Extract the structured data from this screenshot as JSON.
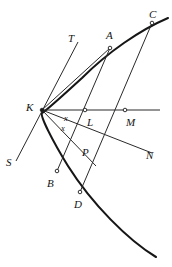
{
  "figure": {
    "kind": "geometry-diagram",
    "background_color": "#ffffff",
    "stroke_color": "#1a1a1a",
    "curve_color": "#161616",
    "view": {
      "width": 172,
      "height": 267
    },
    "labels": [
      {
        "id": "T",
        "text": "T",
        "x": 68,
        "y": 33,
        "size": "normal"
      },
      {
        "id": "A",
        "text": "A",
        "x": 106,
        "y": 30,
        "size": "normal"
      },
      {
        "id": "C",
        "text": "C",
        "x": 149,
        "y": 9,
        "size": "normal"
      },
      {
        "id": "K",
        "text": "K",
        "x": 26,
        "y": 102,
        "size": "normal"
      },
      {
        "id": "x1",
        "text": "x",
        "x": 64,
        "y": 114,
        "size": "small"
      },
      {
        "id": "L",
        "text": "L",
        "x": 87,
        "y": 117,
        "size": "normal"
      },
      {
        "id": "M",
        "text": "M",
        "x": 126,
        "y": 117,
        "size": "normal"
      },
      {
        "id": "x2",
        "text": "x",
        "x": 61,
        "y": 124,
        "size": "small"
      },
      {
        "id": "S",
        "text": "S",
        "x": 6,
        "y": 157,
        "size": "normal"
      },
      {
        "id": "P",
        "text": "P",
        "x": 82,
        "y": 147,
        "size": "normal"
      },
      {
        "id": "N",
        "text": "N",
        "x": 146,
        "y": 150,
        "size": "normal"
      },
      {
        "id": "B",
        "text": "B",
        "x": 47,
        "y": 178,
        "size": "normal"
      },
      {
        "id": "D",
        "text": "D",
        "x": 74,
        "y": 199,
        "size": "normal"
      }
    ],
    "points": [
      {
        "id": "K",
        "x": 42,
        "y": 110
      },
      {
        "id": "A",
        "x": 110,
        "y": 48
      },
      {
        "id": "C",
        "x": 152,
        "y": 23
      },
      {
        "id": "L",
        "x": 85,
        "y": 110
      },
      {
        "id": "M",
        "x": 125,
        "y": 110
      },
      {
        "id": "B",
        "x": 57,
        "y": 171
      },
      {
        "id": "D",
        "x": 80,
        "y": 192
      }
    ],
    "segments": [
      {
        "id": "axis-KM",
        "from": [
          42,
          110
        ],
        "to": [
          160,
          110
        ]
      },
      {
        "id": "tangent-ST",
        "from": [
          16,
          161
        ],
        "to": [
          78,
          42
        ]
      },
      {
        "id": "normal-KN",
        "from": [
          42,
          110
        ],
        "to": [
          152,
          153
        ]
      },
      {
        "id": "chord-KA",
        "from": [
          42,
          110
        ],
        "to": [
          110,
          48
        ]
      },
      {
        "id": "chord-AB",
        "from": [
          110,
          48
        ],
        "to": [
          57,
          171
        ]
      },
      {
        "id": "chord-CD",
        "from": [
          152,
          23
        ],
        "to": [
          80,
          192
        ]
      },
      {
        "id": "ray-KP",
        "from": [
          42,
          110
        ],
        "to": [
          96,
          166
        ]
      }
    ],
    "curve": {
      "id": "parabola",
      "path": "M 168 18 C 140 30 108 52 82 78 C 58 100 44 112 42 113 C 40 116 52 140 68 166 C 92 204 128 240 156 257"
    }
  }
}
